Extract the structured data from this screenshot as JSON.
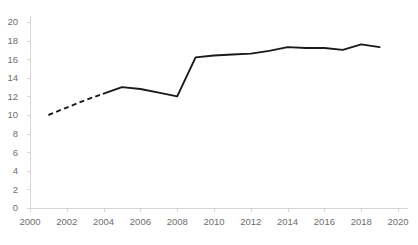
{
  "chart_data": {
    "type": "line",
    "title": "",
    "subtitle": "",
    "xlabel": "",
    "ylabel": "",
    "xlim": [
      2000,
      2020
    ],
    "ylim": [
      0,
      20
    ],
    "grid": false,
    "legend": "none",
    "x_ticks": [
      "2000",
      "2002",
      "2004",
      "2006",
      "2008",
      "2010",
      "2012",
      "2014",
      "2016",
      "2018",
      "2020"
    ],
    "y_ticks": [
      "0",
      "2",
      "4",
      "6",
      "8",
      "10",
      "12",
      "14",
      "16",
      "18",
      "20"
    ],
    "x_tick_values": [
      2000,
      2002,
      2004,
      2006,
      2008,
      2010,
      2012,
      2014,
      2016,
      2018,
      2020
    ],
    "y_tick_values": [
      0,
      2,
      4,
      6,
      8,
      10,
      12,
      14,
      16,
      18,
      20
    ],
    "series": [
      {
        "name": "estimated",
        "style": "dashed",
        "color": "#1a1a1a",
        "x": [
          2001,
          2002,
          2003,
          2004
        ],
        "values": [
          10.0,
          10.8,
          11.6,
          12.3
        ]
      },
      {
        "name": "observed",
        "style": "solid",
        "color": "#1a1a1a",
        "x": [
          2004,
          2005,
          2006,
          2007,
          2008,
          2009,
          2010,
          2011,
          2012,
          2013,
          2014,
          2015,
          2016,
          2017,
          2018,
          2019
        ],
        "values": [
          12.3,
          13.0,
          12.8,
          12.4,
          12.0,
          16.2,
          16.4,
          16.5,
          16.6,
          16.9,
          17.3,
          17.2,
          17.2,
          17.0,
          17.6,
          17.3
        ]
      }
    ],
    "colors": {
      "line": "#1a1a1a",
      "axis": "#d6d6d6",
      "tick_label": "#6e6e6e",
      "background": "#ffffff"
    }
  }
}
